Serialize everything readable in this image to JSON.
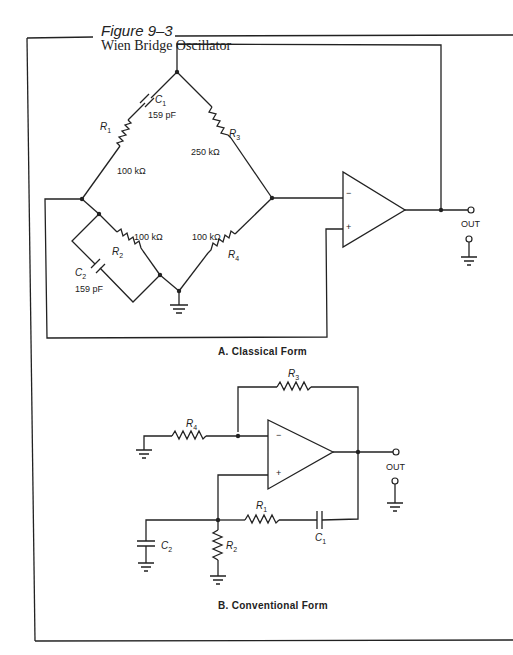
{
  "figure": {
    "number": "Figure 9–3",
    "title": "Wien Bridge Oscillator"
  },
  "classical": {
    "caption": "A.  Classical Form",
    "components": {
      "c1": {
        "ref": "C",
        "sub": "1",
        "value": "159 pF"
      },
      "r1": {
        "ref": "R",
        "sub": "1",
        "value": "100 kΩ"
      },
      "r3": {
        "ref": "R",
        "sub": "3",
        "value": "250 kΩ"
      },
      "r2": {
        "ref": "R",
        "sub": "2",
        "value": "100 kΩ"
      },
      "c2": {
        "ref": "C",
        "sub": "2",
        "value": "159 pF"
      },
      "r4": {
        "ref": "R",
        "sub": "4",
        "value": "100 kΩ"
      }
    },
    "opamp": {
      "minus": "−",
      "plus": "+"
    },
    "output_label": "OUT"
  },
  "conventional": {
    "caption": "B.  Conventional Form",
    "components": {
      "r3": {
        "ref": "R",
        "sub": "3"
      },
      "r4": {
        "ref": "R",
        "sub": "4"
      },
      "r1": {
        "ref": "R",
        "sub": "1"
      },
      "c1": {
        "ref": "C",
        "sub": "1"
      },
      "r2": {
        "ref": "R",
        "sub": "2"
      },
      "c2": {
        "ref": "C",
        "sub": "2"
      }
    },
    "opamp": {
      "minus": "−",
      "plus": "+"
    },
    "output_label": "OUT"
  }
}
